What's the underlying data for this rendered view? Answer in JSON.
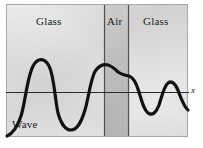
{
  "figure": {
    "panel": {
      "x": 6,
      "y": 4,
      "width": 182,
      "height": 133,
      "background_light": "#f0f0f0",
      "background_mid": "#d8d8d8",
      "border_color": "#9a9a9a"
    },
    "regions": [
      {
        "id": "region-glass-left",
        "label": "Glass",
        "x0": 6,
        "x1": 104,
        "shade": "#d5d5d5",
        "label_x": 36,
        "label_y": 22
      },
      {
        "id": "region-air",
        "label": "Air",
        "x0": 104,
        "x1": 129,
        "shade": "#b9b9b9",
        "label_x": 108,
        "label_y": 22
      },
      {
        "id": "region-glass-right",
        "label": "Glass",
        "x0": 129,
        "x1": 188,
        "shade": "#d5d5d5",
        "label_x": 143,
        "label_y": 22
      }
    ],
    "boundaries": [
      {
        "id": "boundary-left",
        "x": 104,
        "color": "#4a4a4a"
      },
      {
        "id": "boundary-right",
        "x": 129,
        "color": "#4a4a4a"
      }
    ],
    "axis": {
      "label": "x",
      "label_x": 191,
      "label_y": 86,
      "y": 92,
      "x_start": 6,
      "x_end": 189,
      "color": "#2b2b2b",
      "width": 1
    },
    "wave": {
      "label": "Wave",
      "label_x": 12,
      "label_y": 120,
      "color": "#111111",
      "stroke_width": 3.2,
      "path": "M 7 136 C 12 134 17 128 21 116 C 25 104 27 78 33 66 C 38 57 45 58 49 66 C 54 75 55 100 58 113 C 61 124 66 130 71 130 C 77 130 81 123 85 110 C 89 96 91 76 96 70 C 100 65 104 64 108 65 C 112 66 115 69 118 72 C 121 74 124 75 129 76 C 133 77 136 82 139 92 C 142 102 144 110 148 113 C 152 116 156 113 159 105 C 162 96 164 86 168 83 C 172 80 176 84 179 93 C 182 101 185 108 188 110"
    }
  }
}
